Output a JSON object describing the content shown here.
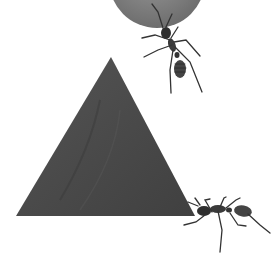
{
  "image": {
    "description": "Two ants carrying geometric shapes: a grey circle at the top and a dark grey triangle",
    "background": "#ffffff",
    "shapes": [
      {
        "type": "circle",
        "name": "grey-circle",
        "color": "#7a7a7a",
        "cx": 157,
        "cy": -20,
        "r": 48
      },
      {
        "type": "triangle",
        "name": "dark-triangle",
        "color": "#4a4a4a",
        "points": "111,57 16,216 195,216"
      }
    ],
    "ants": [
      {
        "name": "top-ant",
        "x": 170,
        "y": 45
      },
      {
        "name": "bottom-right-ant",
        "x": 225,
        "y": 212
      }
    ]
  }
}
